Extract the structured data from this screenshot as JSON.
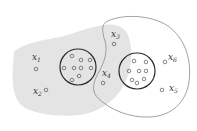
{
  "diagram": {
    "colors": {
      "background": "#ffffff",
      "shaded_region": "#e4e4e4",
      "outline": "#8a8a8a",
      "circle": "#2a2a2a",
      "point": "#555555"
    },
    "regions": [
      {
        "id": "shaded-region",
        "fill": "gray"
      },
      {
        "id": "outlined-region",
        "fill": "none"
      }
    ],
    "clusters": [
      {
        "id": "left-cluster",
        "cx": 78,
        "cy": 67,
        "r": 18,
        "points": [
          [
            72,
            56
          ],
          [
            81,
            60
          ],
          [
            90,
            60
          ],
          [
            64,
            68
          ],
          [
            74,
            68
          ],
          [
            81,
            68
          ],
          [
            91,
            68
          ],
          [
            79,
            76
          ],
          [
            72,
            80
          ]
        ]
      },
      {
        "id": "right-cluster",
        "cx": 137,
        "cy": 71,
        "r": 18,
        "points": [
          [
            134,
            61
          ],
          [
            146,
            62
          ],
          [
            129,
            71
          ],
          [
            139,
            71
          ],
          [
            146,
            71
          ],
          [
            132,
            80
          ],
          [
            137,
            83
          ],
          [
            144,
            79
          ]
        ]
      }
    ],
    "labeled_points": [
      {
        "name": "x",
        "sub": "1",
        "label_x": 32,
        "label_y": 60,
        "px": 36,
        "py": 69
      },
      {
        "name": "x",
        "sub": "2",
        "label_x": 33,
        "label_y": 94,
        "px": 46,
        "py": 90
      },
      {
        "name": "x",
        "sub": "3",
        "label_x": 111,
        "label_y": 37,
        "px": 114,
        "py": 44
      },
      {
        "name": "x",
        "sub": "4",
        "label_x": 102,
        "label_y": 76,
        "px": 103,
        "py": 83
      },
      {
        "name": "x",
        "sub": "5",
        "label_x": 169,
        "label_y": 91,
        "px": 162,
        "py": 90
      },
      {
        "name": "x",
        "sub": "6",
        "label_x": 168,
        "label_y": 60,
        "px": 165,
        "py": 62
      }
    ]
  }
}
